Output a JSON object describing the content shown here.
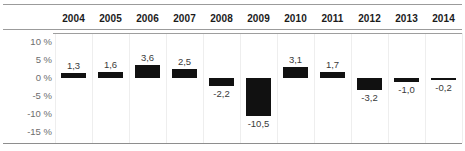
{
  "chart_data": {
    "type": "bar",
    "title": "",
    "xlabel": "",
    "ylabel": "",
    "categories": [
      "2004",
      "2005",
      "2006",
      "2007",
      "2008",
      "2009",
      "2010",
      "2011",
      "2012",
      "2013",
      "2014"
    ],
    "values": [
      1.3,
      1.6,
      3.6,
      2.5,
      -2.2,
      -10.5,
      3.1,
      1.7,
      -3.2,
      -1.0,
      -0.2
    ],
    "value_labels": [
      "1,3",
      "1,6",
      "3,6",
      "2,5",
      "-2,2",
      "-10,5",
      "3,1",
      "1,7",
      "-3,2",
      "-1,0",
      "-0,2"
    ],
    "ylim": [
      -15,
      10
    ],
    "ytick_values": [
      10,
      5,
      0,
      -5,
      -10,
      -15
    ],
    "ytick_labels": [
      "10 %",
      "5 %",
      "0 %",
      "-5 %",
      "-10 %",
      "-15 %"
    ],
    "grid": "vertical",
    "legend": "none",
    "bar_color": "#111111",
    "baseline_value": 0,
    "axis_label_color": "#6d6d6d",
    "header_text_color": "#1b1b1b",
    "rule_color": "#9b9b9b",
    "gridline_color": "#eeeeee"
  }
}
